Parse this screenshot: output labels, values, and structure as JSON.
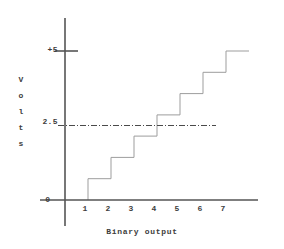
{
  "figure": {
    "background_color": "#ffffff",
    "line_color": "#9a9a9a",
    "axis_color": "#555555",
    "text_color": "#3d3d3d",
    "reference_line_color": "#4a4a4a"
  },
  "axes": {
    "y_label_letters": [
      "V",
      "o",
      "l",
      "t",
      "s"
    ],
    "y_label": "Volts",
    "y_ticks": [
      {
        "value": 0,
        "label": "0"
      },
      {
        "value": 2.5,
        "label": "2.5"
      },
      {
        "value": 5,
        "label": "+5"
      }
    ],
    "x_label": "Binary output",
    "x_ticks": [
      {
        "value": 1,
        "label": "1"
      },
      {
        "value": 2,
        "label": "2"
      },
      {
        "value": 3,
        "label": "3"
      },
      {
        "value": 4,
        "label": "4"
      },
      {
        "value": 5,
        "label": "5"
      },
      {
        "value": 6,
        "label": "6"
      },
      {
        "value": 7,
        "label": "7"
      }
    ]
  },
  "chart_data": {
    "type": "line",
    "title": "",
    "subtitle": "",
    "xlabel": "Binary output",
    "ylabel": "Volts",
    "xlim": [
      0,
      8
    ],
    "ylim": [
      0,
      5.3
    ],
    "grid": false,
    "legend": "none",
    "step_style": "post",
    "x": [
      1,
      2,
      3,
      4,
      5,
      6,
      7
    ],
    "categories": [
      "1",
      "2",
      "3",
      "4",
      "5",
      "6",
      "7"
    ],
    "values": [
      0.714,
      1.429,
      2.143,
      2.857,
      3.571,
      4.286,
      5.0
    ],
    "series": [
      {
        "name": "Analog output",
        "values": [
          0.714,
          1.429,
          2.143,
          2.857,
          3.571,
          4.286,
          5.0
        ]
      }
    ],
    "step_size_volts": 0.714,
    "annotations": [
      {
        "type": "horizontal-reference-line",
        "label": "2.5",
        "y": 2.5,
        "style": "dash-dot"
      }
    ],
    "y_tick_labels": [
      "0",
      "2.5",
      "+5"
    ],
    "y_tick_values": [
      0,
      2.5,
      5
    ],
    "x_tick_labels": [
      "1",
      "2",
      "3",
      "4",
      "5",
      "6",
      "7"
    ],
    "x_tick_values": [
      1,
      2,
      3,
      4,
      5,
      6,
      7
    ]
  }
}
